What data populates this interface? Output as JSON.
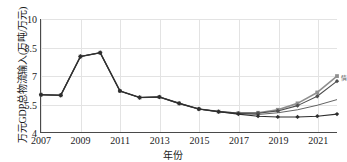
{
  "chart_data": {
    "type": "line",
    "title": "",
    "xlabel": "年份",
    "ylabel": "万元GDP总物流输入(万吨/万元)",
    "grid": true,
    "legend_position": "right-edge",
    "xlim": [
      2007,
      2022
    ],
    "ylim": [
      4,
      10
    ],
    "yticks": [
      "4",
      "5.5",
      "7",
      "8.5",
      "10"
    ],
    "ytick_values": [
      4,
      5.5,
      7,
      8.5,
      10
    ],
    "xticks": [
      "2007",
      "2009",
      "2011",
      "2013",
      "2015",
      "2017",
      "2019",
      "2021"
    ],
    "xtick_values": [
      2007,
      2009,
      2011,
      2013,
      2015,
      2017,
      2019,
      2021
    ],
    "x": [
      2007,
      2008,
      2009,
      2010,
      2011,
      2012,
      2013,
      2014,
      2015,
      2016,
      2017,
      2018,
      2019,
      2020,
      2021,
      2022
    ],
    "series": [
      {
        "name": "情景一",
        "color": "#8f8f8f",
        "marker": "square",
        "values": [
          5.98,
          5.95,
          8.01,
          8.21,
          6.18,
          5.83,
          5.86,
          5.52,
          5.22,
          5.08,
          5.0,
          5.02,
          5.18,
          5.52,
          6.1,
          6.97
        ]
      },
      {
        "name": "情景二",
        "color": "#4f4f4f",
        "marker": "diamond",
        "values": [
          5.98,
          5.95,
          8.01,
          8.21,
          6.18,
          5.83,
          5.86,
          5.52,
          5.22,
          5.08,
          5.0,
          5.0,
          5.12,
          5.4,
          5.9,
          6.7
        ]
      },
      {
        "name": "情景三",
        "color": "#3a3a3a",
        "marker": "none",
        "values": [
          5.98,
          5.95,
          8.01,
          8.21,
          6.18,
          5.83,
          5.86,
          5.52,
          5.22,
          5.08,
          4.98,
          4.93,
          5.02,
          5.18,
          5.42,
          5.72
        ]
      },
      {
        "name": "情景四",
        "color": "#2e2e2e",
        "marker": "diamond",
        "values": [
          5.98,
          5.95,
          8.01,
          8.21,
          6.18,
          5.83,
          5.86,
          5.52,
          5.22,
          5.08,
          4.95,
          4.84,
          4.8,
          4.8,
          4.84,
          4.95
        ]
      }
    ],
    "end_labels": [
      {
        "text": "情",
        "series": 0
      }
    ]
  }
}
